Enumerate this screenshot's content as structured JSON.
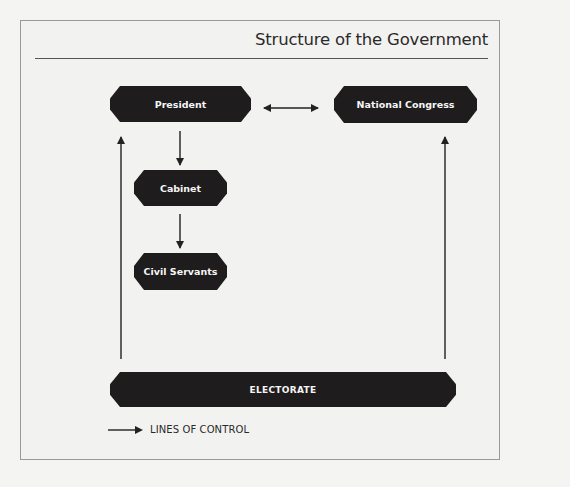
{
  "title": "Structure of the Government",
  "nodes": {
    "president": "President",
    "national_congress": "National Congress",
    "cabinet": "Cabinet",
    "civil_servants": "Civil Servants",
    "electorate": "ELECTORATE"
  },
  "edges": [
    {
      "from": "President",
      "to": "National Congress",
      "type": "bidirectional"
    },
    {
      "from": "President",
      "to": "Cabinet",
      "type": "directed"
    },
    {
      "from": "Cabinet",
      "to": "Civil Servants",
      "type": "directed"
    },
    {
      "from": "ELECTORATE",
      "to": "President",
      "type": "directed"
    },
    {
      "from": "ELECTORATE",
      "to": "National Congress",
      "type": "directed"
    }
  ],
  "legend": {
    "icon": "right-arrow-icon",
    "label": "LINES OF CONTROL"
  },
  "colors": {
    "node_fill": "#1f1c1d",
    "node_text": "#f5f5f5",
    "background": "#f2f2f0",
    "line": "#222222"
  }
}
